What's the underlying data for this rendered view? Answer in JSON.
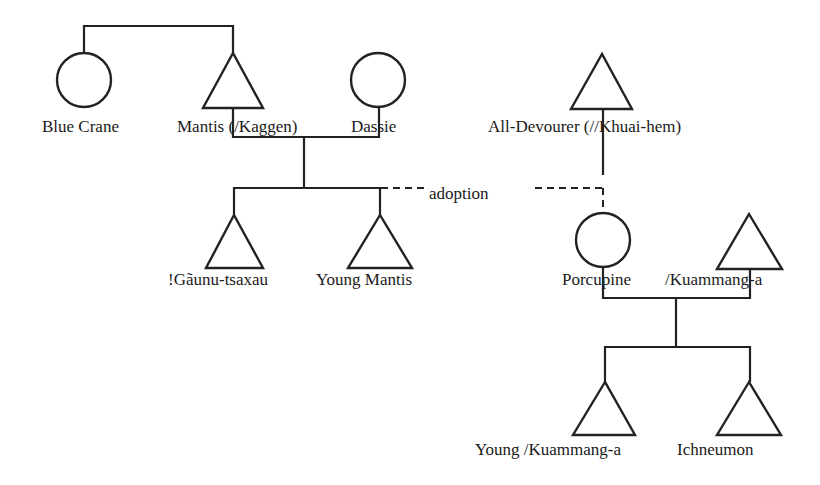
{
  "diagram": {
    "type": "kinship-chart",
    "annotation": "adoption",
    "colors": {
      "line": "#222222",
      "background": "#ffffff",
      "text": "#1a1a1a"
    },
    "people": [
      {
        "id": "blue-crane",
        "label": "Blue Crane",
        "sex": "female",
        "symbol": "circle"
      },
      {
        "id": "mantis",
        "label": "Mantis (/Kaggen)",
        "sex": "male",
        "symbol": "triangle"
      },
      {
        "id": "dassie",
        "label": "Dassie",
        "sex": "female",
        "symbol": "circle"
      },
      {
        "id": "all-devourer",
        "label": "All-Devourer (//Khuai-hem)",
        "sex": "male",
        "symbol": "triangle"
      },
      {
        "id": "gaunu-tsaxau",
        "label": "!Gãunu-tsaxau",
        "sex": "male",
        "symbol": "triangle"
      },
      {
        "id": "young-mantis",
        "label": "Young Mantis",
        "sex": "male",
        "symbol": "triangle"
      },
      {
        "id": "porcupine",
        "label": "Porcupine",
        "sex": "female",
        "symbol": "circle"
      },
      {
        "id": "kuammang-a",
        "label": "/Kuammang-a",
        "sex": "male",
        "symbol": "triangle"
      },
      {
        "id": "young-kuammang-a",
        "label": "Young /Kuammang-a",
        "sex": "male",
        "symbol": "triangle"
      },
      {
        "id": "ichneumon",
        "label": "Ichneumon",
        "sex": "male",
        "symbol": "triangle"
      }
    ],
    "relations": [
      {
        "type": "sibling",
        "members": [
          "Blue Crane",
          "Mantis (/Kaggen)"
        ]
      },
      {
        "type": "marriage",
        "members": [
          "Mantis (/Kaggen)",
          "Dassie"
        ]
      },
      {
        "type": "children",
        "parents": [
          "Mantis (/Kaggen)",
          "Dassie"
        ],
        "children": [
          "!Gãunu-tsaxau",
          "Young Mantis"
        ]
      },
      {
        "type": "adoption",
        "from": "All-Devourer (//Khuai-hem)",
        "to": "Porcupine",
        "adoptive_family": "Mantis (/Kaggen)"
      },
      {
        "type": "marriage",
        "members": [
          "Porcupine",
          "/Kuammang-a"
        ]
      },
      {
        "type": "children",
        "parents": [
          "Porcupine",
          "/Kuammang-a"
        ],
        "children": [
          "Young /Kuammang-a",
          "Ichneumon"
        ]
      }
    ]
  }
}
